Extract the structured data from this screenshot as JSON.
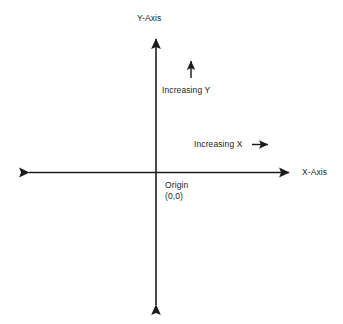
{
  "diagram": {
    "type": "cartesian-axes",
    "background_color": "#ffffff",
    "stroke_color": "#1c1c1c",
    "text_color": "#1c1c1c",
    "labels": {
      "y_axis": "Y-Axis",
      "x_axis": "X-Axis",
      "increasing_y": "Increasing Y",
      "increasing_x": "Increasing X",
      "origin": "Origin",
      "origin_coords": "(0,0)"
    },
    "geometry": {
      "origin_x": 156,
      "origin_y": 172,
      "x_axis_left_tip": 22,
      "x_axis_right_tip": 296,
      "y_axis_top_tip": 32,
      "y_axis_bottom_tip": 312,
      "increasing_y_arrow": {
        "x": 191,
        "y_start": 78,
        "y_tip": 55
      },
      "increasing_x_arrow": {
        "y": 144,
        "x_start": 252,
        "x_tip": 274
      }
    }
  }
}
